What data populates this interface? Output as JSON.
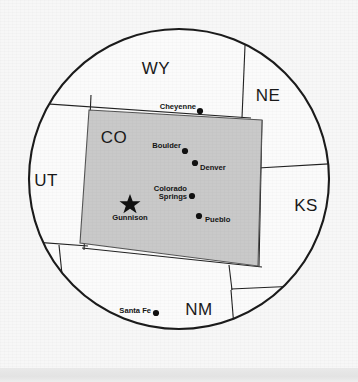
{
  "figure": {
    "kind": "circular-inset-map",
    "title_visible": false,
    "background_color": "#f7f7f7",
    "outline_color": "#1b1b1b",
    "highlight_state": "CO",
    "highlight_fill": "#c9c9c9",
    "bottom_band_color": "#e6e6e6"
  },
  "circle": {
    "cx": 179,
    "cy": 179,
    "r": 151
  },
  "states": [
    {
      "code": "WY",
      "label": "WY",
      "x": 156,
      "y": 74
    },
    {
      "code": "NE",
      "label": "NE",
      "x": 268,
      "y": 101
    },
    {
      "code": "CO",
      "label": "CO",
      "x": 114,
      "y": 143
    },
    {
      "code": "UT",
      "label": "UT",
      "x": 46,
      "y": 186
    },
    {
      "code": "KS",
      "label": "KS",
      "x": 306,
      "y": 211
    },
    {
      "code": "NM",
      "label": "NM",
      "x": 199,
      "y": 315
    }
  ],
  "cities": [
    {
      "name": "Cheyenne",
      "marker": "dot",
      "dot_x": 200,
      "dot_y": 111,
      "label_x": 196,
      "label_y": 107,
      "label_anchor": "end"
    },
    {
      "name": "Boulder",
      "marker": "dot",
      "dot_x": 185,
      "dot_y": 150,
      "label_x": 181,
      "label_y": 147,
      "label_anchor": "end"
    },
    {
      "name": "Denver",
      "marker": "dot",
      "dot_x": 194,
      "dot_y": 161,
      "label_x": 199,
      "label_y": 168,
      "label_anchor": "start"
    },
    {
      "name": "Colorado Springs",
      "marker": "dot",
      "dot_x": 191,
      "dot_y": 193,
      "label_line1": "Colorado",
      "label_line2": "Springs",
      "label_x": 186,
      "label_y": 188,
      "label_anchor": "end"
    },
    {
      "name": "Pueblo",
      "marker": "dot",
      "dot_x": 199,
      "dot_y": 216,
      "label_x": 205,
      "label_y": 222,
      "label_anchor": "start"
    },
    {
      "name": "Gunnison",
      "marker": "star",
      "dot_x": 130,
      "dot_y": 203,
      "label_x": 130,
      "label_y": 219,
      "label_anchor": "middle"
    },
    {
      "name": "Santa Fe",
      "marker": "dot",
      "dot_x": 155,
      "dot_y": 312,
      "label_x": 151,
      "label_y": 312,
      "label_anchor": "end"
    }
  ],
  "colorado_outline": {
    "description": "tilted rectangle representing the state of Colorado",
    "points": "89,110 262,120 258,266 80,243"
  },
  "map_notes": {
    "marker_legend_star": "state capital / highlighted city",
    "marker_legend_dot": "city"
  }
}
